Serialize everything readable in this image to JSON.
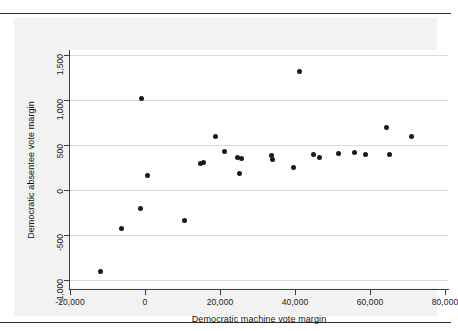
{
  "figure": {
    "background_color": "#f2f2f2",
    "plot_background_color": "#ffffff",
    "point_color": "#1a1a1a",
    "gridline_color": "#dcdcdc",
    "axis_color": "#3d3d3d"
  },
  "chart_data": {
    "type": "scatter",
    "title": "",
    "xlabel": "Democratic machine vote margin",
    "ylabel": "Democratic absentee vote margin",
    "xlim": [
      -20000,
      80000
    ],
    "ylim": [
      -1000,
      1500
    ],
    "xticks": [
      -20000,
      0,
      20000,
      40000,
      60000,
      80000
    ],
    "xtick_labels": [
      "-20,000",
      "0",
      "20,000",
      "40,000",
      "60,000",
      "80,000"
    ],
    "yticks": [
      -1000,
      -500,
      0,
      500,
      1000,
      1500
    ],
    "ytick_labels": [
      "-1,000",
      "-500",
      "0",
      "500",
      "1,000",
      "1,500"
    ],
    "grid": "horizontal",
    "legend": null,
    "marker": "filled-circle",
    "n_points": 25,
    "points": [
      {
        "x": -12000,
        "y": -900
      },
      {
        "x": -6300,
        "y": -430
      },
      {
        "x": -1000,
        "y": 1020
      },
      {
        "x": -1100,
        "y": -210
      },
      {
        "x": 750,
        "y": 165
      },
      {
        "x": 10400,
        "y": -340
      },
      {
        "x": 14900,
        "y": 295
      },
      {
        "x": 15700,
        "y": 305
      },
      {
        "x": 18900,
        "y": 600
      },
      {
        "x": 21300,
        "y": 425
      },
      {
        "x": 24600,
        "y": 365
      },
      {
        "x": 25600,
        "y": 355
      },
      {
        "x": 25100,
        "y": 185
      },
      {
        "x": 33600,
        "y": 380
      },
      {
        "x": 34100,
        "y": 335
      },
      {
        "x": 39500,
        "y": 250
      },
      {
        "x": 41100,
        "y": 1320
      },
      {
        "x": 44800,
        "y": 390
      },
      {
        "x": 46500,
        "y": 360
      },
      {
        "x": 51700,
        "y": 410
      },
      {
        "x": 55900,
        "y": 415
      },
      {
        "x": 58700,
        "y": 400
      },
      {
        "x": 64300,
        "y": 690
      },
      {
        "x": 65100,
        "y": 400
      },
      {
        "x": 71000,
        "y": 595
      }
    ]
  }
}
